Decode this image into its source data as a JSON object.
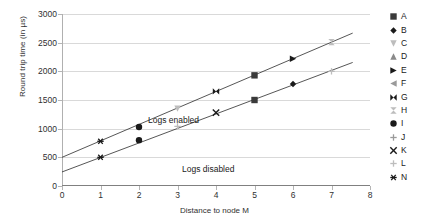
{
  "chart_data": {
    "type": "scatter",
    "title": "",
    "xlabel": "Distance to node M",
    "ylabel": "Round trip time (in µs)",
    "xlim": [
      0,
      8
    ],
    "ylim": [
      0,
      3000
    ],
    "xticks": [
      "0",
      "1",
      "2",
      "3",
      "4",
      "5",
      "6",
      "7",
      "8"
    ],
    "yticks": [
      "0",
      "500",
      "1000",
      "1500",
      "2000",
      "2500",
      "3000"
    ],
    "grid": "horizontal",
    "legend_position": "right",
    "annotations": [
      {
        "text": "Logs enabled",
        "x": 1.0,
        "y": 1330
      },
      {
        "text": "Logs disabled",
        "x": 2.1,
        "y": 480
      }
    ],
    "series": [
      {
        "name": "Logs enabled",
        "trendline": {
          "intercept": 500,
          "slope": 287
        },
        "points": [
          {
            "x": 1,
            "y": 780,
            "marker": "N",
            "shape": "asterisk",
            "color": "#1a1a1a"
          },
          {
            "x": 2,
            "y": 1030,
            "marker": "I",
            "shape": "circle",
            "color": "#1a1a1a"
          },
          {
            "x": 3,
            "y": 1350,
            "marker": "C",
            "shape": "triangle-down",
            "color": "#bdbdbd"
          },
          {
            "x": 4,
            "y": 1650,
            "marker": "G",
            "shape": "bowtie",
            "color": "#1a1a1a"
          },
          {
            "x": 5,
            "y": 1930,
            "marker": "A",
            "shape": "square",
            "color": "#3a3a3a"
          },
          {
            "x": 6,
            "y": 2220,
            "marker": "E",
            "shape": "triangle-right",
            "color": "#1a1a1a"
          },
          {
            "x": 7,
            "y": 2510,
            "marker": "H",
            "shape": "bowtie-vertical",
            "color": "#bdbdbd"
          }
        ]
      },
      {
        "name": "Logs disabled",
        "trendline": {
          "intercept": 245,
          "slope": 253
        },
        "points": [
          {
            "x": 1,
            "y": 500,
            "marker": "N",
            "shape": "asterisk",
            "color": "#1a1a1a"
          },
          {
            "x": 2,
            "y": 800,
            "marker": "I",
            "shape": "circle",
            "color": "#1a1a1a"
          },
          {
            "x": 3,
            "y": 1040,
            "marker": "L",
            "shape": "plus",
            "color": "#bdbdbd"
          },
          {
            "x": 4,
            "y": 1280,
            "marker": "K",
            "shape": "cross",
            "color": "#1a1a1a"
          },
          {
            "x": 5,
            "y": 1500,
            "marker": "A",
            "shape": "square",
            "color": "#3a3a3a"
          },
          {
            "x": 6,
            "y": 1780,
            "marker": "B",
            "shape": "diamond",
            "color": "#1a1a1a"
          },
          {
            "x": 7,
            "y": 2000,
            "marker": "J",
            "shape": "plus",
            "color": "#bdbdbd"
          }
        ]
      }
    ],
    "legend": [
      {
        "label": "A",
        "shape": "square",
        "color": "#3a3a3a"
      },
      {
        "label": "B",
        "shape": "diamond",
        "color": "#1a1a1a"
      },
      {
        "label": "C",
        "shape": "triangle-down",
        "color": "#bdbdbd"
      },
      {
        "label": "D",
        "shape": "triangle-up",
        "color": "#8a8a8a"
      },
      {
        "label": "E",
        "shape": "triangle-right",
        "color": "#1a1a1a"
      },
      {
        "label": "F",
        "shape": "triangle-left",
        "color": "#9a9a9a"
      },
      {
        "label": "G",
        "shape": "bowtie",
        "color": "#1a1a1a"
      },
      {
        "label": "H",
        "shape": "bowtie-vertical",
        "color": "#bdbdbd"
      },
      {
        "label": "I",
        "shape": "circle",
        "color": "#1a1a1a"
      },
      {
        "label": "J",
        "shape": "plus",
        "color": "#9a9a9a"
      },
      {
        "label": "K",
        "shape": "cross",
        "color": "#1a1a1a"
      },
      {
        "label": "L",
        "shape": "plus",
        "color": "#bdbdbd"
      },
      {
        "label": "N",
        "shape": "asterisk",
        "color": "#1a1a1a"
      }
    ]
  }
}
